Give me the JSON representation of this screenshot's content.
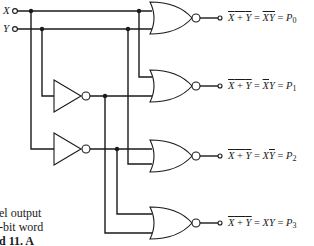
{
  "inputs": {
    "x_label": "X",
    "y_label": "Y"
  },
  "outputs": [
    {
      "lhs_a": "X",
      "lhs_plus": " + ",
      "lhs_b": "Y",
      "eq1": " = ",
      "rhs_a": "X",
      "rhs_b": "Y",
      "eq2": " = ",
      "out": "P",
      "sub": "0",
      "rhs_a_bar": true,
      "rhs_b_bar": true
    },
    {
      "lhs_a": "X",
      "lhs_plus": " + ",
      "lhs_b": "Y",
      "eq1": " = ",
      "rhs_a": "X",
      "rhs_b": "Y",
      "eq2": " = ",
      "out": "P",
      "sub": "1",
      "rhs_a_bar": true,
      "rhs_b_bar": false
    },
    {
      "lhs_a": "X",
      "lhs_plus": " + ",
      "lhs_b": "Y",
      "eq1": " = ",
      "rhs_a": "X",
      "rhs_b": "Y",
      "eq2": " = ",
      "out": "P",
      "sub": "2",
      "rhs_a_bar": false,
      "rhs_b_bar": true
    },
    {
      "lhs_a": "X",
      "lhs_plus": " + ",
      "lhs_b": "Y",
      "eq1": " = ",
      "rhs_a": "X",
      "rhs_b": "Y",
      "eq2": " = ",
      "out": "P",
      "sub": "3",
      "rhs_a_bar": false,
      "rhs_b_bar": false
    }
  ],
  "caption_fragments": [
    "el output",
    "-bit word",
    "d 11. A"
  ],
  "components": {
    "gates": [
      "nor-gate-p0",
      "nor-gate-p1",
      "nor-gate-p2",
      "nor-gate-p3"
    ],
    "inverters": [
      "inverter-y",
      "inverter-x"
    ]
  }
}
